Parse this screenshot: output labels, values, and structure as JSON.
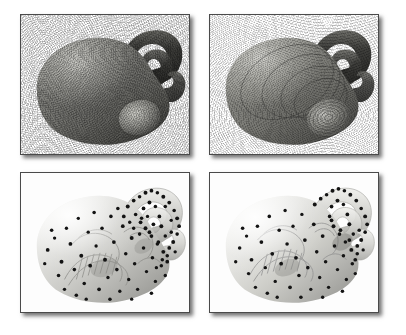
{
  "figure": {
    "background_color": "#ffffff",
    "grid": {
      "rows": 2,
      "columns": 2
    },
    "panel_border_color": "#4a4a4a",
    "panel_background": "#fdfdfd",
    "shadow_color": "#000000",
    "sample_point_color": "#111111",
    "surface_light": "#f2f2f0",
    "surface_mid": "#b9b9b5",
    "surface_dark": "#6a6a67",
    "handle_dark": "#3a3a38"
  },
  "panels": [
    {
      "id": "panel-top-left",
      "position": "top-left",
      "render_style": "opaque-stippled-shaded-surface",
      "description": "Opaque gray blob-shaped surface with dense stipple noise texture and two dark tubular handle loops at the upper right; a rounded protrusion at the lower right.",
      "opacity": "opaque",
      "shows_sample_points": "no",
      "shows_interior": "no",
      "texture": "stipple"
    },
    {
      "id": "panel-top-right",
      "position": "top-right",
      "render_style": "opaque-mesh-contour-surface",
      "description": "Same blob surface rendered with a fine mesh of contour ripples; concentric rings converge on the rounded protrusion at the lower right.",
      "opacity": "opaque",
      "shows_sample_points": "no",
      "shows_interior": "no",
      "texture": "contour-ripple"
    },
    {
      "id": "panel-bottom-left",
      "position": "bottom-left",
      "render_style": "translucent-surface-with-sample-points",
      "description": "Translucent pale-gray blob surface revealing an internal helical ladder structure; scattered black sample points cover the surface, densest around the handle loops.",
      "opacity": "translucent",
      "shows_sample_points": "yes",
      "shows_interior": "yes",
      "texture": "smooth",
      "sample_point_count": "102"
    },
    {
      "id": "panel-bottom-right",
      "position": "bottom-right",
      "render_style": "translucent-surface-with-sample-points",
      "description": "Same translucent blob from a slightly different shading, with internal helical structure and scattered black sample points concentrated near the handles.",
      "opacity": "translucent",
      "shows_sample_points": "yes",
      "shows_interior": "yes",
      "texture": "smooth",
      "sample_point_count": "88"
    }
  ]
}
